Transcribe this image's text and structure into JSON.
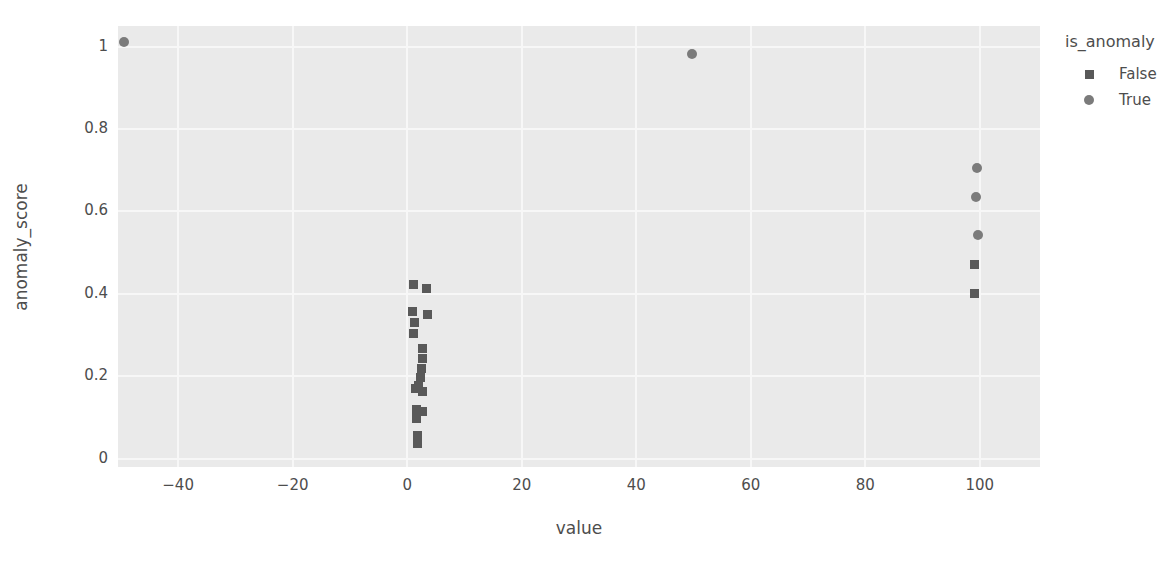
{
  "chart_data": {
    "type": "scatter",
    "title": "",
    "xlabel": "value",
    "ylabel": "anomaly_score",
    "xlim": [
      -50.5,
      110.5
    ],
    "ylim": [
      -0.02,
      1.05
    ],
    "xticks": [
      -40,
      -20,
      0,
      20,
      40,
      60,
      80,
      100
    ],
    "xticklabels": [
      "−40",
      "−20",
      "0",
      "20",
      "40",
      "60",
      "80",
      "100"
    ],
    "yticks": [
      0,
      0.2,
      0.4,
      0.6,
      0.8,
      1
    ],
    "yticklabels": [
      "0",
      "0.2",
      "0.4",
      "0.6",
      "0.8",
      "1"
    ],
    "grid": true,
    "panel_background": "#eaeaea",
    "grid_color": "#f7f7f7",
    "legend": {
      "title": "is_anomaly",
      "position": "right",
      "entries": [
        {
          "label": "False",
          "marker": "square",
          "color": "#595959"
        },
        {
          "label": "True",
          "marker": "circle",
          "color": "#7b7b7b"
        }
      ]
    },
    "series": [
      {
        "name": "False",
        "marker": "square",
        "color": "#595959",
        "points": [
          {
            "x": 1.1,
            "y": 0.422
          },
          {
            "x": 3.4,
            "y": 0.412
          },
          {
            "x": 1.0,
            "y": 0.358
          },
          {
            "x": 3.5,
            "y": 0.35
          },
          {
            "x": 1.2,
            "y": 0.33
          },
          {
            "x": 1.1,
            "y": 0.305
          },
          {
            "x": 2.6,
            "y": 0.268
          },
          {
            "x": 2.6,
            "y": 0.243
          },
          {
            "x": 2.5,
            "y": 0.218
          },
          {
            "x": 2.4,
            "y": 0.196
          },
          {
            "x": 2.0,
            "y": 0.178
          },
          {
            "x": 1.5,
            "y": 0.17
          },
          {
            "x": 2.7,
            "y": 0.164
          },
          {
            "x": 1.6,
            "y": 0.12
          },
          {
            "x": 2.6,
            "y": 0.114
          },
          {
            "x": 1.6,
            "y": 0.097
          },
          {
            "x": 1.8,
            "y": 0.056
          },
          {
            "x": 1.8,
            "y": 0.038
          },
          {
            "x": 99.0,
            "y": 0.472
          },
          {
            "x": 99.0,
            "y": 0.402
          }
        ]
      },
      {
        "name": "True",
        "marker": "circle",
        "color": "#7b7b7b",
        "points": [
          {
            "x": -49.5,
            "y": 1.01
          },
          {
            "x": 49.8,
            "y": 0.982
          },
          {
            "x": 99.5,
            "y": 0.706
          },
          {
            "x": 99.3,
            "y": 0.634
          },
          {
            "x": 99.7,
            "y": 0.542
          }
        ]
      }
    ]
  }
}
